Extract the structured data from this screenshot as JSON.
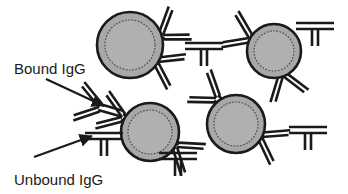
{
  "figure": {
    "background_color": "#ffffff",
    "width": 348,
    "height": 194
  },
  "labels": {
    "bound": "Bound IgG",
    "unbound": "Unbound IgG"
  },
  "colors": {
    "ink": "#1a1a1a",
    "bead_fill": "#a8a8a8",
    "bead_inner_fill": "#b0b0b0",
    "bead_outline": "#1a1a1a",
    "background": "#ffffff"
  },
  "beads": [
    {
      "name": "bead-top-left",
      "cx": 130,
      "cy": 45,
      "r": 33,
      "inner_r": 25
    },
    {
      "name": "bead-top-right",
      "cx": 274,
      "cy": 51,
      "r": 27,
      "inner_r": 20
    },
    {
      "name": "bead-bottom-left",
      "cx": 150,
      "cy": 132,
      "r": 29,
      "inner_r": 22
    },
    {
      "name": "bead-bottom-right",
      "cx": 236,
      "cy": 124,
      "r": 29,
      "inner_r": 22
    }
  ],
  "bound_antibodies": [
    {
      "name": "bound-igg-tl-upper",
      "x": 163,
      "y": 35,
      "angle": -35,
      "scale": 1.0
    },
    {
      "name": "bound-igg-tl-lower",
      "x": 158,
      "y": 62,
      "angle": 28,
      "scale": 1.0
    },
    {
      "name": "bound-igg-tr-left",
      "x": 249,
      "y": 38,
      "angle": 205,
      "scale": 1.0
    },
    {
      "name": "bound-igg-tr-lower",
      "x": 283,
      "y": 76,
      "angle": 72,
      "scale": 1.0
    },
    {
      "name": "bound-igg-bl-left",
      "x": 122,
      "y": 117,
      "angle": 200,
      "scale": 1.0
    },
    {
      "name": "bound-igg-bl-right",
      "x": 177,
      "y": 147,
      "angle": 38,
      "scale": 1.0
    },
    {
      "name": "bound-igg-bl-far-left",
      "x": 99,
      "y": 107,
      "angle": 196,
      "scale": 1.0
    },
    {
      "name": "bound-igg-br-upper",
      "x": 216,
      "y": 98,
      "angle": 216,
      "scale": 1.0
    },
    {
      "name": "bound-igg-br-right",
      "x": 262,
      "y": 137,
      "angle": 30,
      "scale": 1.0
    }
  ],
  "unbound_antibodies": [
    {
      "name": "unbound-igg-top-center",
      "x": 204,
      "y": 50,
      "angle": 0
    },
    {
      "name": "unbound-igg-top-right",
      "x": 315,
      "y": 30,
      "angle": 0
    },
    {
      "name": "unbound-igg-arrow-target",
      "x": 104,
      "y": 140,
      "angle": 0
    },
    {
      "name": "unbound-igg-bottom-mid",
      "x": 178,
      "y": 160,
      "angle": 0
    },
    {
      "name": "unbound-igg-bottom-right",
      "x": 308,
      "y": 134,
      "angle": 0
    }
  ],
  "arrows": [
    {
      "name": "bound-arrow",
      "x1": 46,
      "y1": 79,
      "x2": 104,
      "y2": 106
    },
    {
      "name": "unbound-arrow",
      "x1": 34,
      "y1": 157,
      "x2": 92,
      "y2": 136
    }
  ],
  "label_positions": {
    "bound": {
      "x": 14,
      "y": 74
    },
    "unbound": {
      "x": 14,
      "y": 185
    }
  }
}
